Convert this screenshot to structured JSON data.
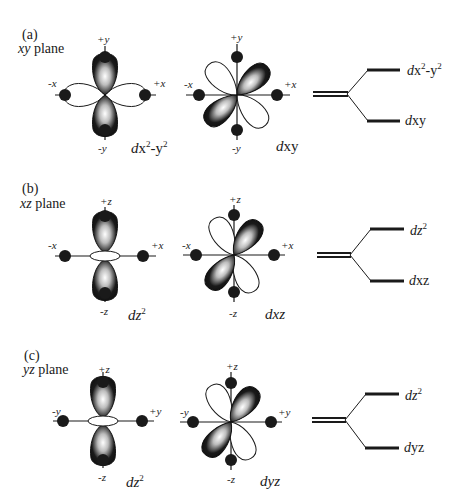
{
  "panels": [
    {
      "id": "a",
      "label": "(a)",
      "plane_var": "xy",
      "plane_word": "plane",
      "orbital1": {
        "axes": {
          "top": "+y",
          "bottom": "-y",
          "left": "-x",
          "right": "+x"
        },
        "name_d": "d",
        "name_main": "x",
        "name_sup1": "2",
        "name_mid": "-y",
        "name_sup2": "2"
      },
      "orbital2": {
        "axes": {
          "top": "+y",
          "bottom": "-y",
          "left": "-x",
          "right": "+x"
        },
        "name_d": "d",
        "name_main": "xy"
      },
      "levels": {
        "upper_d": "d",
        "upper_main": "x",
        "upper_sup1": "2",
        "upper_mid": "-y",
        "upper_sup2": "2",
        "lower_d": "d",
        "lower_main": "xy"
      }
    },
    {
      "id": "b",
      "label": "(b)",
      "plane_var": "xz",
      "plane_word": "plane",
      "orbital1": {
        "axes": {
          "top": "+z",
          "bottom": "-z",
          "left": "-x",
          "right": "+x"
        },
        "name_d": "d",
        "name_main": "z",
        "name_sup1": "2"
      },
      "orbital2": {
        "axes": {
          "top": "+z",
          "bottom": "-z",
          "left": "-x",
          "right": "+x"
        },
        "name_d": "d",
        "name_main": "xz"
      },
      "levels": {
        "upper_d": "d",
        "upper_main": "z",
        "upper_sup1": "2",
        "lower_d": "d",
        "lower_main": "xz"
      }
    },
    {
      "id": "c",
      "label": "(c)",
      "plane_var": "yz",
      "plane_word": "plane",
      "orbital1": {
        "axes": {
          "top": "+z",
          "bottom": "-z",
          "left": "-y",
          "right": "+y"
        },
        "name_d": "d",
        "name_main": "z",
        "name_sup1": "2"
      },
      "orbital2": {
        "axes": {
          "top": "+z",
          "bottom": "-z",
          "left": "-y",
          "right": "+y"
        },
        "name_d": "d",
        "name_main": "yz"
      },
      "levels": {
        "upper_d": "d",
        "upper_main": "z",
        "upper_sup1": "2",
        "lower_d": "d",
        "lower_main": "yz"
      }
    }
  ],
  "colors": {
    "ink": "#1a1a1a",
    "background": "#ffffff"
  }
}
